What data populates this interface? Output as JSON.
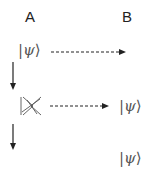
{
  "labels": {
    "party_a": "A",
    "party_b": "B"
  },
  "kets": {
    "initial_state": {
      "left": "|",
      "symbol": "ψ",
      "right": "⟩"
    },
    "received_state": {
      "left": "|",
      "symbol": "ψ",
      "right": "⟩"
    },
    "final_state": {
      "left": "|",
      "symbol": "ψ",
      "right": "⟩"
    }
  },
  "icons": {
    "crossed_out_ket": "no-cloning / destroyed state symbol",
    "transfer_arrow": "dashed right arrow",
    "time_arrow": "solid down arrow"
  },
  "colors": {
    "text": "#222222",
    "ket": "#555555",
    "arrow": "#222222",
    "background": "#ffffff"
  }
}
